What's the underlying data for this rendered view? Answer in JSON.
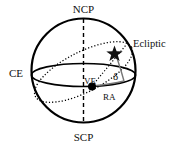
{
  "diagram": {
    "labels": {
      "north_pole": "NCP",
      "south_pole": "SCP",
      "equator": "CE",
      "ecliptic": "Ecliptic",
      "vernal_equinox": "VE",
      "declination": "δ",
      "right_ascension": "RA"
    },
    "icons": {
      "star": "star-icon",
      "vernal_equinox_point": "dot"
    },
    "colors": {
      "stroke": "#000000",
      "background": "#ffffff",
      "arc": "#777777"
    }
  }
}
